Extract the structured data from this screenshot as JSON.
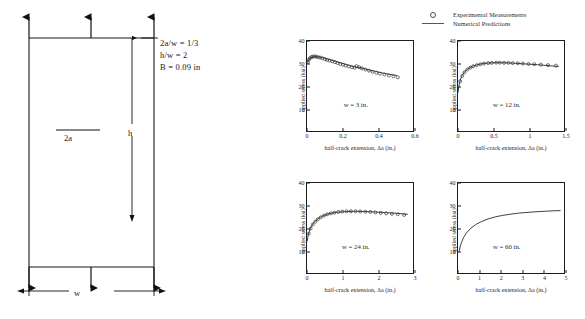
{
  "figure": {
    "specimen": {
      "title": "center-cracked-panel-schematic",
      "notes": [
        "2a/w = 1/3",
        "h/w = 2",
        "B = 0.09 in"
      ],
      "dimension_labels": {
        "crack_length": "2a",
        "height": "h",
        "width": "w"
      },
      "load_arrows_top": 3,
      "load_arrows_bottom": 3
    },
    "legend": {
      "items": [
        {
          "label": "Experimental Measurements",
          "marker": "open-circle"
        },
        {
          "label": "Numerical Predictions",
          "marker": "solid-line"
        }
      ]
    }
  },
  "chart_data": [
    {
      "type": "scatter",
      "title": "",
      "panel_label": "w = 3 in.",
      "xlabel": "half-crack extension, Δa (in.)",
      "ylabel": "applied stress (ksi)",
      "xlim": [
        0,
        0.6
      ],
      "ylim": [
        0,
        40
      ],
      "xticks": [
        0,
        0.2,
        0.4,
        0.6
      ],
      "xtick_labels": [
        "0",
        "0.2",
        "0.4",
        "0.6"
      ],
      "yticks": [
        10,
        20,
        30,
        40
      ],
      "ytick_labels": [
        "10",
        "20",
        "30",
        "40"
      ],
      "grid": false,
      "series": [
        {
          "name": "Numerical Predictions",
          "style": "line",
          "x": [
            0.0,
            0.005,
            0.012,
            0.022,
            0.035,
            0.05,
            0.07,
            0.09,
            0.115,
            0.14,
            0.17,
            0.2,
            0.235,
            0.27,
            0.3,
            0.34,
            0.38,
            0.42,
            0.46,
            0.5
          ],
          "y": [
            30.4,
            31.3,
            32.2,
            32.8,
            33.1,
            33.2,
            33.0,
            32.7,
            32.2,
            31.6,
            30.9,
            30.2,
            29.4,
            28.7,
            28.3,
            27.5,
            26.8,
            26.1,
            25.5,
            25.0
          ]
        },
        {
          "name": "Experimental Measurements",
          "style": "points",
          "x": [
            0.004,
            0.01,
            0.016,
            0.024,
            0.032,
            0.04,
            0.05,
            0.06,
            0.072,
            0.085,
            0.1,
            0.112,
            0.125,
            0.14,
            0.155,
            0.17,
            0.185,
            0.2,
            0.215,
            0.232,
            0.25,
            0.265,
            0.275,
            0.29,
            0.305,
            0.325,
            0.345,
            0.365,
            0.385,
            0.405,
            0.43,
            0.455,
            0.48,
            0.505
          ],
          "y": [
            30.8,
            31.8,
            32.5,
            33.0,
            33.2,
            33.3,
            33.2,
            33.0,
            32.8,
            32.5,
            32.1,
            31.8,
            31.5,
            31.2,
            30.8,
            30.4,
            30.0,
            29.7,
            29.3,
            28.9,
            28.6,
            28.4,
            29.1,
            28.6,
            28.1,
            27.6,
            27.1,
            26.6,
            26.2,
            25.8,
            25.4,
            25.0,
            24.6,
            24.2
          ]
        }
      ]
    },
    {
      "type": "scatter",
      "title": "",
      "panel_label": "w = 12 in.",
      "xlabel": "half-crack extension, Δa (in.)",
      "ylabel": "applied stress (ksi)",
      "xlim": [
        0,
        1.5
      ],
      "ylim": [
        0,
        40
      ],
      "xticks": [
        0,
        0.5,
        1.0,
        1.5
      ],
      "xtick_labels": [
        "0",
        "0.5",
        "1",
        "1.5"
      ],
      "yticks": [
        10,
        20,
        30,
        40
      ],
      "ytick_labels": [
        "10",
        "20",
        "30",
        "40"
      ],
      "grid": false,
      "series": [
        {
          "name": "Numerical Predictions",
          "style": "line",
          "x": [
            0.0,
            0.02,
            0.05,
            0.09,
            0.14,
            0.2,
            0.27,
            0.35,
            0.45,
            0.55,
            0.68,
            0.8,
            0.95,
            1.1,
            1.25,
            1.4
          ],
          "y": [
            17.5,
            21.8,
            24.6,
            26.6,
            28.0,
            29.0,
            29.7,
            30.2,
            30.5,
            30.6,
            30.5,
            30.3,
            30.0,
            29.7,
            29.3,
            28.9
          ]
        },
        {
          "name": "Experimental Measurements",
          "style": "points",
          "x": [
            0.03,
            0.06,
            0.09,
            0.13,
            0.17,
            0.21,
            0.26,
            0.31,
            0.36,
            0.42,
            0.47,
            0.53,
            0.58,
            0.64,
            0.7,
            0.76,
            0.83,
            0.9,
            0.98,
            1.06,
            1.15,
            1.25,
            1.36
          ],
          "y": [
            22.5,
            24.8,
            26.4,
            27.6,
            28.4,
            29.0,
            29.5,
            29.9,
            30.2,
            30.4,
            30.5,
            30.6,
            30.6,
            30.5,
            30.5,
            30.4,
            30.3,
            30.2,
            30.0,
            29.9,
            29.7,
            29.5,
            29.3
          ]
        }
      ]
    },
    {
      "type": "scatter",
      "title": "",
      "panel_label": "w = 24 in.",
      "xlabel": "half-crack extension, Δa (in.)",
      "ylabel": "applied stress (ksi)",
      "xlim": [
        0,
        3
      ],
      "ylim": [
        0,
        40
      ],
      "xticks": [
        0,
        1,
        2,
        3
      ],
      "xtick_labels": [
        "0",
        "1",
        "2",
        "3"
      ],
      "yticks": [
        10,
        20,
        30,
        40
      ],
      "ytick_labels": [
        "10",
        "20",
        "30",
        "40"
      ],
      "grid": false,
      "series": [
        {
          "name": "Numerical Predictions",
          "style": "line",
          "x": [
            0.0,
            0.04,
            0.1,
            0.18,
            0.28,
            0.4,
            0.55,
            0.72,
            0.9,
            1.1,
            1.35,
            1.6,
            1.9,
            2.2,
            2.5,
            2.8
          ],
          "y": [
            14.5,
            17.8,
            20.6,
            22.6,
            24.2,
            25.4,
            26.4,
            27.0,
            27.4,
            27.6,
            27.7,
            27.6,
            27.4,
            27.1,
            26.8,
            26.4
          ]
        },
        {
          "name": "Experimental Measurements",
          "style": "points",
          "x": [
            0.05,
            0.1,
            0.16,
            0.23,
            0.3,
            0.38,
            0.47,
            0.56,
            0.66,
            0.76,
            0.87,
            0.98,
            1.1,
            1.22,
            1.35,
            1.48,
            1.62,
            1.76,
            1.9,
            2.05,
            2.2,
            2.36,
            2.52,
            2.7
          ],
          "y": [
            18.0,
            20.2,
            21.9,
            23.2,
            24.2,
            25.1,
            25.8,
            26.4,
            26.8,
            27.1,
            27.4,
            27.6,
            27.7,
            27.7,
            27.7,
            27.6,
            27.5,
            27.4,
            27.2,
            27.0,
            26.8,
            26.6,
            26.4,
            26.1
          ]
        }
      ]
    },
    {
      "type": "line",
      "title": "",
      "panel_label": "w = 60 in.",
      "xlabel": "half-crack extension, Δa (in.)",
      "ylabel": "applied stress (ksi)",
      "xlim": [
        0,
        5
      ],
      "ylim": [
        0,
        40
      ],
      "xticks": [
        0,
        1,
        2,
        3,
        4,
        5
      ],
      "xtick_labels": [
        "0",
        "1",
        "2",
        "3",
        "4",
        "5"
      ],
      "yticks": [
        10,
        20,
        30,
        40
      ],
      "ytick_labels": [
        "10",
        "20",
        "30",
        "40"
      ],
      "grid": false,
      "series": [
        {
          "name": "Numerical Predictions",
          "style": "line",
          "x": [
            0.05,
            0.12,
            0.25,
            0.4,
            0.6,
            0.85,
            1.1,
            1.4,
            1.7,
            2.05,
            2.4,
            2.8,
            3.2,
            3.6,
            4.0,
            4.4,
            4.75
          ],
          "y": [
            10.2,
            13.0,
            16.2,
            18.4,
            20.4,
            22.1,
            23.3,
            24.4,
            25.2,
            25.9,
            26.4,
            26.9,
            27.2,
            27.5,
            27.7,
            27.9,
            28.0
          ]
        }
      ]
    }
  ]
}
